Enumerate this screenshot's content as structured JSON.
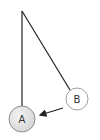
{
  "diagram": {
    "type": "pendulum",
    "pivot": {
      "x": 22,
      "y": 11
    },
    "bobs": [
      {
        "id": "A",
        "label": "A",
        "cx": 22,
        "cy": 119,
        "r": 13,
        "fill": "#e4e4e4",
        "stroke": "#777777",
        "description": "rest position (bottom)"
      },
      {
        "id": "B",
        "label": "B",
        "cx": 77,
        "cy": 99,
        "r": 11,
        "fill": "#ffffff",
        "stroke": "#888888",
        "description": "displaced position"
      }
    ],
    "arrow": {
      "from": "B",
      "to": "A",
      "color": "#222222"
    },
    "string_color": "#222222"
  }
}
